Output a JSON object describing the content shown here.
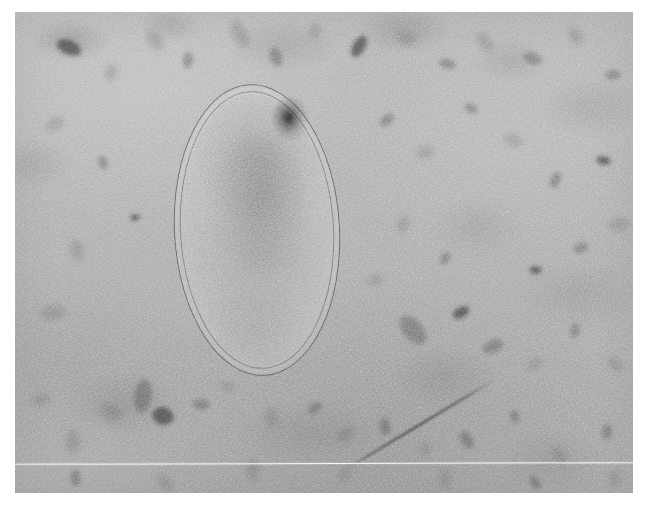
{
  "image": {
    "kind": "transmission-electron-micrograph",
    "subject": "ovoid prokaryotic cell in thin section",
    "background_tone": "#a8a8a7",
    "plate": {
      "left": 15,
      "top": 12,
      "width": 618,
      "height": 481
    },
    "has_visible_text": false,
    "caption": "",
    "scale_bar_label": ""
  },
  "specimen": {
    "label": "cell",
    "shape": "ellipse",
    "center_x": 257,
    "center_y": 230,
    "width": 166,
    "height": 292,
    "rotation_deg": -3,
    "envelope": "double membrane with visible periplasmic gap",
    "outer_membrane_color": "#484848",
    "inner_membrane_color": "#565656",
    "cytoplasm_tone": "#8f8f8f",
    "features": [
      {
        "name": "electron-dense-granule",
        "x": 305,
        "y": 140,
        "tone": "#181818"
      },
      {
        "name": "nucleoid-region",
        "x": 255,
        "y": 195,
        "tone": "#3e3e3e"
      }
    ]
  },
  "artifacts": {
    "scan_line": {
      "label": "white horizontal scan line",
      "y": 463,
      "x_start": 15,
      "x_end": 633,
      "color": "#ffffff"
    },
    "filament": {
      "label": "diagonal filament",
      "x_start": 632,
      "y_start": 382,
      "x_end": 498,
      "y_end": 466,
      "tone": "#343434"
    }
  },
  "debris": [
    {
      "x": 54,
      "y": 35,
      "w": 26,
      "h": 15,
      "class": "dark"
    },
    {
      "x": 96,
      "y": 60,
      "w": 18,
      "h": 11,
      "class": "faint"
    },
    {
      "x": 140,
      "y": 28,
      "w": 22,
      "h": 13,
      "class": "faint"
    },
    {
      "x": 173,
      "y": 48,
      "w": 16,
      "h": 10,
      "class": ""
    },
    {
      "x": 225,
      "y": 22,
      "w": 30,
      "h": 14,
      "class": "faint"
    },
    {
      "x": 261,
      "y": 45,
      "w": 20,
      "h": 12,
      "class": ""
    },
    {
      "x": 300,
      "y": 19,
      "w": 18,
      "h": 10,
      "class": "faint"
    },
    {
      "x": 344,
      "y": 34,
      "w": 24,
      "h": 13,
      "class": "dark"
    },
    {
      "x": 392,
      "y": 27,
      "w": 20,
      "h": 12,
      "class": "faint"
    },
    {
      "x": 432,
      "y": 52,
      "w": 17,
      "h": 10,
      "class": ""
    },
    {
      "x": 470,
      "y": 30,
      "w": 22,
      "h": 12,
      "class": "faint"
    },
    {
      "x": 517,
      "y": 46,
      "w": 19,
      "h": 11,
      "class": ""
    },
    {
      "x": 560,
      "y": 24,
      "w": 21,
      "h": 12,
      "class": "faint"
    },
    {
      "x": 598,
      "y": 63,
      "w": 16,
      "h": 10,
      "class": ""
    },
    {
      "x": 40,
      "y": 112,
      "w": 20,
      "h": 12,
      "class": "faint"
    },
    {
      "x": 88,
      "y": 150,
      "w": 14,
      "h": 9,
      "class": ""
    },
    {
      "x": 120,
      "y": 205,
      "w": 10,
      "h": 7,
      "class": "dark"
    },
    {
      "x": 62,
      "y": 238,
      "w": 22,
      "h": 13,
      "class": "faint"
    },
    {
      "x": 38,
      "y": 300,
      "w": 26,
      "h": 15,
      "class": "faint"
    },
    {
      "x": 372,
      "y": 108,
      "w": 16,
      "h": 10,
      "class": ""
    },
    {
      "x": 410,
      "y": 140,
      "w": 18,
      "h": 11,
      "class": "faint"
    },
    {
      "x": 456,
      "y": 96,
      "w": 14,
      "h": 9,
      "class": ""
    },
    {
      "x": 498,
      "y": 128,
      "w": 20,
      "h": 12,
      "class": "faint"
    },
    {
      "x": 540,
      "y": 168,
      "w": 17,
      "h": 10,
      "class": ""
    },
    {
      "x": 588,
      "y": 148,
      "w": 15,
      "h": 9,
      "class": "dark"
    },
    {
      "x": 604,
      "y": 212,
      "w": 22,
      "h": 13,
      "class": "faint"
    },
    {
      "x": 566,
      "y": 236,
      "w": 16,
      "h": 10,
      "class": ""
    },
    {
      "x": 520,
      "y": 258,
      "w": 13,
      "h": 8,
      "class": "dark"
    },
    {
      "x": 388,
      "y": 212,
      "w": 18,
      "h": 11,
      "class": "faint"
    },
    {
      "x": 430,
      "y": 246,
      "w": 14,
      "h": 9,
      "class": ""
    },
    {
      "x": 360,
      "y": 268,
      "w": 16,
      "h": 10,
      "class": "faint"
    },
    {
      "x": 398,
      "y": 318,
      "w": 34,
      "h": 20,
      "class": ""
    },
    {
      "x": 446,
      "y": 300,
      "w": 18,
      "h": 11,
      "class": "dark"
    },
    {
      "x": 478,
      "y": 334,
      "w": 22,
      "h": 13,
      "class": ""
    },
    {
      "x": 520,
      "y": 352,
      "w": 16,
      "h": 10,
      "class": "faint"
    },
    {
      "x": 560,
      "y": 318,
      "w": 14,
      "h": 9,
      "class": ""
    },
    {
      "x": 600,
      "y": 352,
      "w": 18,
      "h": 11,
      "class": "faint"
    },
    {
      "x": 128,
      "y": 384,
      "w": 34,
      "h": 18,
      "class": ""
    },
    {
      "x": 148,
      "y": 404,
      "w": 22,
      "h": 18,
      "class": "dark"
    },
    {
      "x": 96,
      "y": 400,
      "w": 26,
      "h": 16,
      "class": "faint"
    },
    {
      "x": 186,
      "y": 392,
      "w": 18,
      "h": 11,
      "class": ""
    },
    {
      "x": 212,
      "y": 374,
      "w": 14,
      "h": 9,
      "class": "faint"
    },
    {
      "x": 256,
      "y": 406,
      "w": 20,
      "h": 12,
      "class": "faint"
    },
    {
      "x": 300,
      "y": 396,
      "w": 16,
      "h": 10,
      "class": ""
    },
    {
      "x": 330,
      "y": 422,
      "w": 22,
      "h": 13,
      "class": "faint"
    },
    {
      "x": 370,
      "y": 414,
      "w": 18,
      "h": 11,
      "class": ""
    },
    {
      "x": 410,
      "y": 438,
      "w": 16,
      "h": 10,
      "class": "faint"
    },
    {
      "x": 452,
      "y": 428,
      "w": 20,
      "h": 12,
      "class": ""
    },
    {
      "x": 58,
      "y": 430,
      "w": 24,
      "h": 14,
      "class": "faint"
    },
    {
      "x": 26,
      "y": 388,
      "w": 20,
      "h": 12,
      "class": "faint"
    },
    {
      "x": 500,
      "y": 404,
      "w": 14,
      "h": 9,
      "class": ""
    },
    {
      "x": 544,
      "y": 442,
      "w": 18,
      "h": 11,
      "class": "faint"
    },
    {
      "x": 592,
      "y": 420,
      "w": 16,
      "h": 10,
      "class": ""
    },
    {
      "x": 238,
      "y": 458,
      "w": 22,
      "h": 12,
      "class": "faint"
    },
    {
      "x": 330,
      "y": 462,
      "w": 18,
      "h": 10,
      "class": "faint"
    },
    {
      "x": 430,
      "y": 466,
      "w": 20,
      "h": 11,
      "class": "faint"
    },
    {
      "x": 520,
      "y": 470,
      "w": 16,
      "h": 9,
      "class": ""
    },
    {
      "x": 600,
      "y": 466,
      "w": 18,
      "h": 10,
      "class": "faint"
    },
    {
      "x": 150,
      "y": 470,
      "w": 20,
      "h": 11,
      "class": "faint"
    },
    {
      "x": 60,
      "y": 466,
      "w": 17,
      "h": 10,
      "class": ""
    }
  ]
}
